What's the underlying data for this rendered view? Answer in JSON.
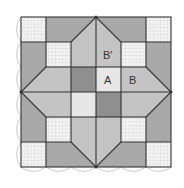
{
  "diagram": {
    "labels": {
      "a": "A",
      "b": "B",
      "b_prime": "B′"
    },
    "colors": {
      "dark": "#8f8f8f",
      "medium": "#a9a9a9",
      "light": "#c4c4c4",
      "lightest": "#e6e6e6",
      "grid_fill": "#f4f4f4",
      "grid_line": "#c8c8c8",
      "outline": "#333333",
      "scallop": "#bbbbbb"
    }
  }
}
